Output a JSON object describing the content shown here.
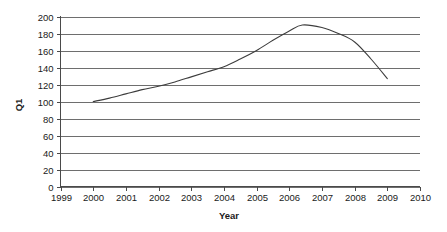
{
  "chart_data": {
    "type": "line",
    "title": "",
    "xlabel": "Year",
    "ylabel": "Q1",
    "xlim": [
      1999,
      2010
    ],
    "ylim": [
      0,
      200
    ],
    "grid": true,
    "legend": false,
    "x_ticks": [
      "1999",
      "2000",
      "2001",
      "2002",
      "2003",
      "2004",
      "2005",
      "2006",
      "2007",
      "2008",
      "2009",
      "2010"
    ],
    "y_ticks": [
      "0",
      "20",
      "40",
      "60",
      "80",
      "100",
      "120",
      "140",
      "160",
      "180",
      "200"
    ],
    "series": [
      {
        "name": "Q1",
        "color": "#3d3d3d",
        "x": [
          2000,
          2000.5,
          2001,
          2001.5,
          2002,
          2002.5,
          2003,
          2003.5,
          2004,
          2004.5,
          2005,
          2005.5,
          2006,
          2006.4,
          2007,
          2007.5,
          2008,
          2008.5,
          2009
        ],
        "values": [
          100,
          104,
          109,
          114,
          118,
          123,
          129,
          135,
          141,
          150,
          160,
          172,
          183,
          190,
          187,
          180,
          170,
          150,
          127
        ]
      }
    ]
  },
  "axes": {
    "y_title": "Q1",
    "x_title": "Year"
  },
  "colors": {
    "series": "#3d3d3d",
    "grid": "#6e6e6e",
    "axis": "#4a4a4a",
    "background": "#ffffff",
    "text": "#1a1a1a"
  }
}
